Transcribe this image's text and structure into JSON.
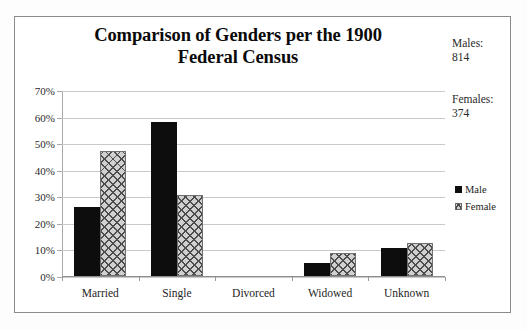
{
  "chart_data": {
    "type": "bar",
    "title": "Comparison of Genders per the 1900 Federal Census",
    "title_lines": [
      "Comparison of Genders per the 1900",
      "Federal Census"
    ],
    "xlabel": "",
    "ylabel": "",
    "categories": [
      "Married",
      "Single",
      "Divorced",
      "Widowed",
      "Unknown"
    ],
    "series": [
      {
        "name": "Male",
        "values": [
          26.0,
          58.0,
          0.0,
          5.0,
          10.7
        ]
      },
      {
        "name": "Female",
        "values": [
          47.0,
          30.5,
          0.0,
          8.5,
          12.3
        ]
      }
    ],
    "ylim": [
      0,
      70
    ],
    "yticks": [
      0,
      10,
      20,
      30,
      40,
      50,
      60,
      70
    ],
    "ytick_labels": [
      "0%",
      "10%",
      "20%",
      "30%",
      "40%",
      "50%",
      "60%",
      "70%"
    ],
    "grid": true,
    "legend_position": "right",
    "legend": [
      "Male",
      "Female"
    ]
  },
  "annotations": {
    "males_label": "Males:",
    "males_value": "814",
    "females_label": "Females:",
    "females_value": "374"
  }
}
